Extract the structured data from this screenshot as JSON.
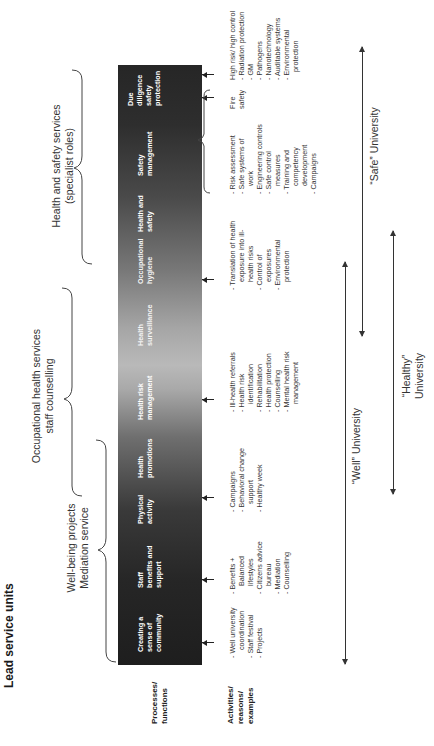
{
  "title": "Lead service units",
  "brace_groups": [
    {
      "label_line1": "Well-being projects",
      "label_line2": "Mediation service"
    },
    {
      "label_line1": "Occupational health services",
      "label_line2": "staff counselling"
    },
    {
      "label_line1": "Health and safety services",
      "label_line2": "(specialist roles)"
    }
  ],
  "row_labels": {
    "processes": {
      "line1": "Processes/",
      "line2": "functions"
    },
    "activities": {
      "line1": "Activities/",
      "line2": "reasons/",
      "line3": "examples"
    }
  },
  "columns": [
    {
      "title": [
        "Creating a",
        "sense of",
        "community"
      ],
      "items": [
        "Well university coordination",
        "Staff festival",
        "Projects"
      ]
    },
    {
      "title": [
        "Staff",
        "benefits and",
        "support"
      ],
      "items": [
        "Benefits + Balanced lifestyles",
        "Citizens advice bureau",
        "Mediation",
        "Counselling"
      ]
    },
    {
      "title": [
        "Physical",
        "activity"
      ],
      "items": []
    },
    {
      "title": [
        "Health",
        "promotions"
      ],
      "items": [
        "Campaigns",
        "Behavioral change support",
        "Healthy week"
      ]
    },
    {
      "title": [
        "Health risk",
        "management"
      ],
      "items": [
        "Ill-health referrals",
        "Health risk identification",
        "Rehabilitation",
        "Health protection",
        "Counselling",
        "Mental health risk management"
      ]
    },
    {
      "title": [
        "Health",
        "surveillance"
      ],
      "items": []
    },
    {
      "title": [
        "Occupational",
        "hygiene"
      ],
      "items": [
        "Translation of health exposure into ill-health risks",
        "Control of exposures",
        "Environmental protection"
      ]
    },
    {
      "title": [
        "Health and",
        "safety"
      ],
      "items": []
    },
    {
      "title": [
        "Safety",
        "management"
      ],
      "items": [
        "Risk assessment",
        "Safe systems of work",
        "Engineering controls",
        "Safe control measures",
        "Training and competency development",
        "Campaigns"
      ]
    },
    {
      "title": [
        "Due",
        "diligence",
        "safety",
        "protection"
      ],
      "items": []
    }
  ],
  "fire_safety": {
    "label": "Fire safety"
  },
  "high_risk": {
    "heading": "High risk/ high control",
    "items": [
      "Radiation protection",
      "GM",
      "Pathogens",
      "Nanotechnology",
      "Auditable systems",
      "Environmental protection"
    ]
  },
  "university_arrows": [
    {
      "label": "“Well” University"
    },
    {
      "label_line1": "“Healthy”",
      "label_line2": "University"
    },
    {
      "label": "“Safe” University"
    }
  ],
  "colors": {
    "bar_dark": "#1e1e1e",
    "bar_light": "#b9b9b9",
    "text": "#333333"
  }
}
